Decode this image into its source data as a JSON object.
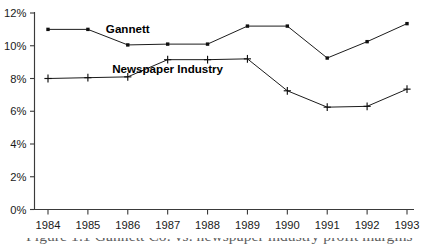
{
  "chart_data": {
    "type": "line",
    "title": "",
    "xlabel": "",
    "ylabel": "",
    "categories": [
      "1984",
      "1985",
      "1986",
      "1987",
      "1988",
      "1989",
      "1990",
      "1991",
      "1992",
      "1993"
    ],
    "series": [
      {
        "name": "Gannett",
        "marker": "square",
        "values": [
          11.0,
          11.0,
          10.05,
          10.1,
          10.1,
          11.2,
          11.2,
          9.25,
          10.25,
          11.35
        ]
      },
      {
        "name": "Newspaper Industry",
        "marker": "plus",
        "values": [
          8.0,
          8.05,
          8.1,
          9.15,
          9.15,
          9.2,
          7.25,
          6.25,
          6.3,
          7.35
        ]
      }
    ],
    "ylim": [
      0,
      12
    ],
    "ytick_values": [
      0,
      2,
      4,
      6,
      8,
      10,
      12
    ],
    "ytick_labels": [
      "0%",
      "2%",
      "4%",
      "6%",
      "8%",
      "10%",
      "12%"
    ],
    "xtick_labels": [
      "1984",
      "1985",
      "1986",
      "1987",
      "1988",
      "1989",
      "1990",
      "1991",
      "1992",
      "1993"
    ],
    "grid": false,
    "legend_position": "inline-annotation",
    "annotations": [
      {
        "text": "Gannett",
        "x_category": "1986",
        "y_value": 10.75
      },
      {
        "text": "Newspaper Industry",
        "x_category": "1987",
        "y_value": 8.35
      }
    ],
    "line_color": "#1c1c1c",
    "axis_color": "#3a3a3a",
    "background_color": "#ffffff"
  },
  "caption": {
    "text": "Figure 1.1   Gannett Co. vs. newspaper industry profit margins"
  }
}
